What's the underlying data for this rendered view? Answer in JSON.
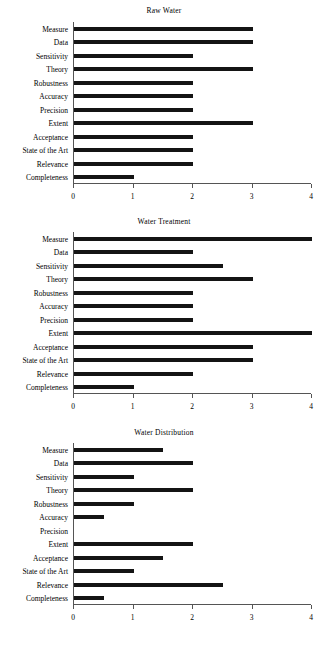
{
  "figure": {
    "categories": [
      "Measure",
      "Data",
      "Sensitivity",
      "Theory",
      "Robustness",
      "Accuracy",
      "Precision",
      "Extent",
      "Acceptance",
      "State of the Art",
      "Relevance",
      "Completeness"
    ],
    "tick_labels": [
      "0",
      "1",
      "2",
      "3",
      "4"
    ],
    "bar_color": "#141414",
    "axis_color": "#555555"
  },
  "chart_data": [
    {
      "type": "bar",
      "orientation": "horizontal",
      "title": "Raw Water",
      "xlabel": "",
      "ylabel": "",
      "xlim": [
        0,
        4
      ],
      "xticks": [
        0,
        1,
        2,
        3,
        4
      ],
      "grid": false,
      "legend": "none",
      "categories": [
        "Measure",
        "Data",
        "Sensitivity",
        "Theory",
        "Robustness",
        "Accuracy",
        "Precision",
        "Extent",
        "Acceptance",
        "State of the Art",
        "Relevance",
        "Completeness"
      ],
      "values": [
        3,
        3,
        2,
        3,
        2,
        2,
        2,
        3,
        2,
        2,
        2,
        1
      ]
    },
    {
      "type": "bar",
      "orientation": "horizontal",
      "title": "Water Treatment",
      "xlabel": "",
      "ylabel": "",
      "xlim": [
        0,
        4
      ],
      "xticks": [
        0,
        1,
        2,
        3,
        4
      ],
      "grid": false,
      "legend": "none",
      "categories": [
        "Measure",
        "Data",
        "Sensitivity",
        "Theory",
        "Robustness",
        "Accuracy",
        "Precision",
        "Extent",
        "Acceptance",
        "State of the Art",
        "Relevance",
        "Completeness"
      ],
      "values": [
        4,
        2,
        2.5,
        3,
        2,
        2,
        2,
        4,
        3,
        3,
        2,
        1
      ]
    },
    {
      "type": "bar",
      "orientation": "horizontal",
      "title": "Water Distribution",
      "xlabel": "",
      "ylabel": "",
      "xlim": [
        0,
        4
      ],
      "xticks": [
        0,
        1,
        2,
        3,
        4
      ],
      "grid": false,
      "legend": "none",
      "categories": [
        "Measure",
        "Data",
        "Sensitivity",
        "Theory",
        "Robustness",
        "Accuracy",
        "Precision",
        "Extent",
        "Acceptance",
        "State of the Art",
        "Relevance",
        "Completeness"
      ],
      "values": [
        1.5,
        2,
        1,
        2,
        1,
        0.5,
        0,
        2,
        1.5,
        1,
        2.5,
        0.5
      ]
    }
  ]
}
